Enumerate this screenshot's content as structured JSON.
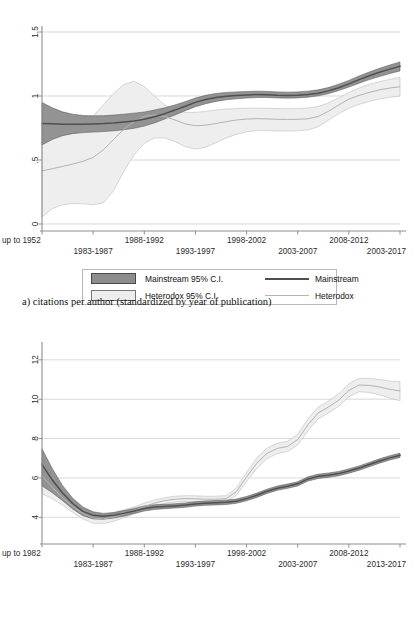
{
  "figure": {
    "caption_a": "a)  citations per author (standardized by year of publication)"
  },
  "legend": {
    "mainstream_ci_label": "Mainstream 95% C.I.",
    "heterodox_ci_label": "Heterodox 95% C.I.",
    "mainstream_line_label": "Mainstream",
    "heterodox_line_label": "Heterodox",
    "mainstream_fill_color": "#8d8d8d",
    "heterodox_fill_color": "#ededed",
    "mainstream_line_color": "#4f4f4f",
    "heterodox_line_color": "#b3b3b3"
  },
  "chart_data": [
    {
      "id": "chart-a",
      "type": "line",
      "title": "",
      "subtitle": "a)  citations per author (standardized by year of publication)",
      "xlabel": "",
      "ylabel": "",
      "grid": true,
      "legend_position": "below",
      "ylim": [
        0,
        1.5
      ],
      "yticks": [
        0,
        0.5,
        1,
        1.5
      ],
      "ytick_labels": [
        "0",
        ".5",
        "1",
        "1.5"
      ],
      "xtick_labels": [
        "up to 1952",
        "1983-1987",
        "1988-1992",
        "1993-1997",
        "1998-2002",
        "2003-2007",
        "2008-2012",
        "2003-2017"
      ],
      "x": [
        0,
        1,
        2,
        3,
        4,
        5,
        6,
        7
      ],
      "series": [
        {
          "name": "Mainstream",
          "color": "#4f4f4f",
          "fill_color": "#8d8d8d",
          "x": [
            0.0,
            0.2,
            0.4,
            0.6,
            0.8,
            1.0,
            1.2,
            1.4,
            1.6,
            1.8,
            2.0,
            2.2,
            2.4,
            2.6,
            2.8,
            3.0,
            3.2,
            3.4,
            3.6,
            3.8,
            4.0,
            4.2,
            4.4,
            4.6,
            4.8,
            5.0,
            5.2,
            5.4,
            5.6,
            5.8,
            6.0,
            6.2,
            6.4,
            6.6,
            6.8,
            7.0
          ],
          "values": [
            0.785,
            0.783,
            0.78,
            0.779,
            0.78,
            0.782,
            0.785,
            0.79,
            0.797,
            0.805,
            0.818,
            0.838,
            0.862,
            0.89,
            0.92,
            0.95,
            0.972,
            0.988,
            0.998,
            1.003,
            1.008,
            1.012,
            1.01,
            1.006,
            1.004,
            1.006,
            1.012,
            1.022,
            1.04,
            1.065,
            1.095,
            1.128,
            1.158,
            1.185,
            1.21,
            1.232
          ],
          "lower": [
            0.618,
            0.66,
            0.69,
            0.706,
            0.714,
            0.718,
            0.722,
            0.728,
            0.736,
            0.748,
            0.765,
            0.79,
            0.82,
            0.852,
            0.885,
            0.916,
            0.94,
            0.958,
            0.97,
            0.978,
            0.984,
            0.988,
            0.988,
            0.985,
            0.983,
            0.985,
            0.991,
            1.001,
            1.018,
            1.042,
            1.07,
            1.1,
            1.128,
            1.152,
            1.175,
            1.196
          ],
          "upper": [
            0.95,
            0.908,
            0.876,
            0.858,
            0.848,
            0.845,
            0.846,
            0.851,
            0.858,
            0.866,
            0.875,
            0.89,
            0.908,
            0.93,
            0.956,
            0.984,
            1.005,
            1.02,
            1.028,
            1.032,
            1.035,
            1.038,
            1.036,
            1.032,
            1.03,
            1.032,
            1.038,
            1.048,
            1.066,
            1.092,
            1.122,
            1.156,
            1.188,
            1.216,
            1.242,
            1.266
          ]
        },
        {
          "name": "Heterodox",
          "color": "#b3b3b3",
          "fill_color": "#ededed",
          "x": [
            0.0,
            0.2,
            0.4,
            0.6,
            0.8,
            1.0,
            1.2,
            1.4,
            1.6,
            1.8,
            2.0,
            2.2,
            2.4,
            2.6,
            2.8,
            3.0,
            3.2,
            3.4,
            3.6,
            3.8,
            4.0,
            4.2,
            4.4,
            4.6,
            4.8,
            5.0,
            5.2,
            5.4,
            5.6,
            5.8,
            6.0,
            6.2,
            6.4,
            6.6,
            6.8,
            7.0
          ],
          "values": [
            0.415,
            0.432,
            0.45,
            0.468,
            0.49,
            0.52,
            0.58,
            0.66,
            0.74,
            0.8,
            0.84,
            0.852,
            0.84,
            0.812,
            0.782,
            0.768,
            0.772,
            0.785,
            0.8,
            0.812,
            0.82,
            0.823,
            0.821,
            0.818,
            0.817,
            0.818,
            0.822,
            0.84,
            0.88,
            0.93,
            0.975,
            1.005,
            1.028,
            1.048,
            1.062,
            1.072
          ],
          "lower": [
            0.055,
            0.12,
            0.15,
            0.16,
            0.158,
            0.15,
            0.165,
            0.26,
            0.41,
            0.54,
            0.63,
            0.672,
            0.672,
            0.645,
            0.605,
            0.585,
            0.6,
            0.635,
            0.672,
            0.7,
            0.72,
            0.73,
            0.73,
            0.727,
            0.726,
            0.728,
            0.735,
            0.76,
            0.81,
            0.862,
            0.905,
            0.935,
            0.958,
            0.976,
            0.99,
            1.0
          ],
          "upper": [
            0.782,
            0.762,
            0.752,
            0.76,
            0.79,
            0.845,
            0.93,
            1.02,
            1.09,
            1.115,
            1.075,
            1.0,
            0.93,
            0.888,
            0.872,
            0.872,
            0.88,
            0.89,
            0.898,
            0.902,
            0.905,
            0.906,
            0.904,
            0.902,
            0.901,
            0.902,
            0.906,
            0.918,
            0.945,
            0.985,
            1.028,
            1.062,
            1.09,
            1.112,
            1.13,
            1.145
          ]
        }
      ]
    },
    {
      "id": "chart-b",
      "type": "line",
      "title": "",
      "xlabel": "",
      "ylabel": "",
      "grid": true,
      "legend_position": "below",
      "ylim": [
        3.0,
        12.6
      ],
      "yticks": [
        4,
        6,
        8,
        10,
        12
      ],
      "ytick_labels": [
        "4",
        "6",
        "8",
        "10",
        "12"
      ],
      "xtick_labels": [
        "up to 1982",
        "1983-1987",
        "1988-1992",
        "1993-1997",
        "1998-2002",
        "2003-2007",
        "2008-2012",
        "2013-2017"
      ],
      "x": [
        0,
        1,
        2,
        3,
        4,
        5,
        6,
        7
      ],
      "series": [
        {
          "name": "Mainstream",
          "color": "#4f4f4f",
          "fill_color": "#8d8d8d",
          "x": [
            0.0,
            0.2,
            0.4,
            0.6,
            0.8,
            1.0,
            1.2,
            1.4,
            1.6,
            1.8,
            2.0,
            2.2,
            2.4,
            2.6,
            2.8,
            3.0,
            3.2,
            3.4,
            3.6,
            3.8,
            4.0,
            4.2,
            4.4,
            4.6,
            4.8,
            5.0,
            5.2,
            5.4,
            5.6,
            5.8,
            6.0,
            6.2,
            6.4,
            6.6,
            6.8,
            7.0
          ],
          "values": [
            6.68,
            5.9,
            5.25,
            4.7,
            4.3,
            4.1,
            4.05,
            4.1,
            4.2,
            4.32,
            4.45,
            4.52,
            4.55,
            4.58,
            4.62,
            4.68,
            4.72,
            4.74,
            4.76,
            4.82,
            4.95,
            5.12,
            5.32,
            5.48,
            5.58,
            5.7,
            5.95,
            6.08,
            6.14,
            6.22,
            6.35,
            6.5,
            6.68,
            6.86,
            7.02,
            7.15
          ],
          "lower": [
            5.6,
            5.25,
            4.85,
            4.42,
            4.08,
            3.92,
            3.9,
            3.96,
            4.06,
            4.19,
            4.32,
            4.4,
            4.44,
            4.47,
            4.51,
            4.57,
            4.61,
            4.63,
            4.65,
            4.71,
            4.84,
            5.01,
            5.21,
            5.37,
            5.47,
            5.59,
            5.84,
            5.97,
            6.03,
            6.11,
            6.24,
            6.39,
            6.57,
            6.75,
            6.91,
            7.04
          ],
          "upper": [
            7.48,
            6.48,
            5.62,
            4.97,
            4.52,
            4.28,
            4.2,
            4.24,
            4.34,
            4.45,
            4.58,
            4.64,
            4.66,
            4.69,
            4.73,
            4.79,
            4.83,
            4.85,
            4.87,
            4.93,
            5.06,
            5.23,
            5.43,
            5.59,
            5.69,
            5.81,
            6.06,
            6.19,
            6.25,
            6.33,
            6.46,
            6.61,
            6.79,
            6.97,
            7.13,
            7.26
          ]
        },
        {
          "name": "Heterodox",
          "color": "#b3b3b3",
          "fill_color": "#ededed",
          "x": [
            0.0,
            0.2,
            0.4,
            0.6,
            0.8,
            1.0,
            1.2,
            1.4,
            1.6,
            1.8,
            2.0,
            2.2,
            2.4,
            2.6,
            2.8,
            3.0,
            3.2,
            3.4,
            3.6,
            3.8,
            4.0,
            4.2,
            4.4,
            4.6,
            4.8,
            5.0,
            5.2,
            5.4,
            5.6,
            5.8,
            6.0,
            6.2,
            6.4,
            6.6,
            6.8,
            7.0
          ],
          "values": [
            6.1,
            5.52,
            5.0,
            4.55,
            4.2,
            3.96,
            3.92,
            4.02,
            4.18,
            4.35,
            4.55,
            4.72,
            4.85,
            4.92,
            4.95,
            4.94,
            4.92,
            4.92,
            4.95,
            5.3,
            6.05,
            6.75,
            7.25,
            7.5,
            7.6,
            7.95,
            8.7,
            9.3,
            9.6,
            9.95,
            10.45,
            10.72,
            10.7,
            10.62,
            10.5,
            10.42
          ],
          "lower": [
            5.2,
            4.95,
            4.62,
            4.25,
            3.92,
            3.7,
            3.68,
            3.8,
            3.98,
            4.17,
            4.38,
            4.56,
            4.7,
            4.77,
            4.8,
            4.79,
            4.77,
            4.77,
            4.8,
            5.12,
            5.82,
            6.48,
            6.98,
            7.24,
            7.34,
            7.68,
            8.4,
            9.0,
            9.3,
            9.64,
            10.12,
            10.38,
            10.34,
            10.22,
            10.06,
            9.92
          ],
          "upper": [
            7.05,
            6.18,
            5.42,
            4.88,
            4.48,
            4.22,
            4.16,
            4.24,
            4.38,
            4.53,
            4.72,
            4.88,
            5.0,
            5.07,
            5.1,
            5.09,
            5.07,
            5.07,
            5.1,
            5.48,
            6.28,
            7.02,
            7.52,
            7.76,
            7.86,
            8.22,
            9.0,
            9.6,
            9.9,
            10.26,
            10.78,
            11.06,
            11.06,
            11.0,
            10.92,
            10.88
          ]
        }
      ]
    }
  ]
}
